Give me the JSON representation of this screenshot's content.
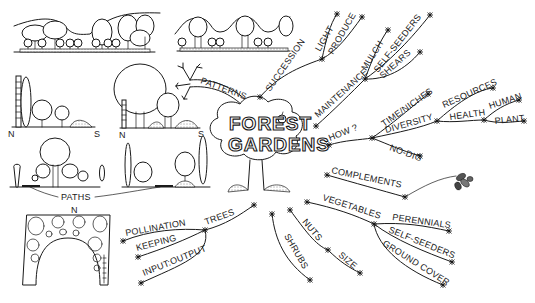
{
  "title": {
    "line1": "FOREST",
    "line2": "GARDENS"
  },
  "branches": {
    "patterns": {
      "label": "PATTERNS",
      "sketches": {
        "ns_label_n": "N",
        "ns_label_s": "S",
        "ns_label_n2": "N",
        "ns_label_s2": "S",
        "paths_label": "PATHS",
        "plan_north": "N"
      }
    },
    "succession": {
      "label": "SUCCESSION",
      "children": [
        {
          "label": "LIGHT"
        },
        {
          "label": "PRODUCE"
        }
      ]
    },
    "maintenance": {
      "label": "MAINTENANCE",
      "children": [
        {
          "label": "MULCH"
        },
        {
          "label": "SELF-SEEDERS"
        },
        {
          "label": "SHEARS"
        }
      ]
    },
    "how": {
      "label": "HOW ?",
      "children": [
        {
          "label": "TIME/NICHES"
        },
        {
          "label": "DIVERSITY"
        },
        {
          "label": "NO-DIG"
        }
      ],
      "diversity_children": [
        {
          "label": "RESOURCES"
        },
        {
          "label": "HEALTH"
        }
      ],
      "health_children": [
        {
          "label": "HUMAN"
        },
        {
          "label": "PLANT"
        }
      ]
    },
    "complements": {
      "label": "COMPLEMENTS"
    },
    "vegetables": {
      "label": "VEGETABLES",
      "children": [
        {
          "label": "PERENNIALS"
        },
        {
          "label": "SELF-SEEDERS"
        },
        {
          "label": "GROUND COVER"
        }
      ]
    },
    "nuts": {
      "label": "NUTS",
      "children": [
        {
          "label": "SIZE"
        }
      ]
    },
    "shrubs": {
      "label": "SHRUBS"
    },
    "trees": {
      "label": "TREES",
      "children": [
        {
          "label": "POLLINATION"
        },
        {
          "label": "KEEPING"
        },
        {
          "label": "INPUT:OUTPUT"
        }
      ]
    }
  },
  "colors": {
    "ink": "#1a1a1a",
    "paper": "#ffffff"
  }
}
